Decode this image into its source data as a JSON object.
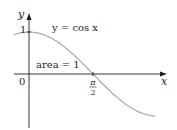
{
  "chart_data": {
    "type": "line",
    "title": "",
    "function_label": "y = cos x",
    "annotation": "area = 1",
    "xlabel": "x",
    "ylabel": "y",
    "origin_label": "0",
    "y_ticks": [
      {
        "value": 1,
        "label": "1"
      }
    ],
    "x_ticks": [
      {
        "value": 1.5708,
        "label_num": "π",
        "label_den": "2"
      }
    ],
    "series": [
      {
        "name": "cos x",
        "x": [
          -0.37,
          0,
          0.5,
          1.0,
          1.5708,
          2.0,
          2.5,
          3.1
        ],
        "values": [
          0.93,
          1.0,
          0.88,
          0.54,
          0.0,
          -0.42,
          -0.8,
          -1.0
        ]
      }
    ],
    "shaded_region": {
      "from_x": 0,
      "to_x": 1.5708,
      "area": 1
    },
    "xlim": [
      -0.37,
      3.35
    ],
    "ylim": [
      -1.3,
      1.4
    ],
    "grid": false,
    "colors": {
      "axis": "#231f20",
      "curve": "#a7a9ac",
      "text": "#231f20"
    }
  }
}
